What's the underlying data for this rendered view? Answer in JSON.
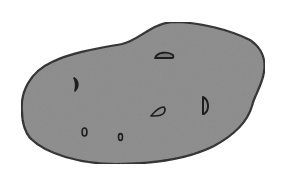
{
  "image": {
    "subject": "Potato illustration",
    "background_color": "#ffffff",
    "fill_color": "#8b8b8b",
    "outline_color": "#222222",
    "eyes_count": 6
  }
}
